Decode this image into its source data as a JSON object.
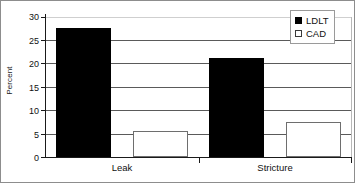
{
  "chart_data": {
    "type": "bar",
    "title": "",
    "subtitle": "",
    "xlabel": "",
    "ylabel": "Percent",
    "categories": [
      "Leak",
      "Stricture"
    ],
    "series": [
      {
        "name": "LDLT",
        "values": [
          27.4,
          21.0
        ],
        "color": "#000000",
        "marker": "filled-square"
      },
      {
        "name": "CAD",
        "values": [
          5.5,
          7.4
        ],
        "color": "#ffffff",
        "marker": "open-square"
      }
    ],
    "ylim": [
      0,
      30
    ],
    "ytick_step": 5,
    "ytick_labels": [
      "0",
      "5",
      "10",
      "15",
      "20",
      "25",
      "30"
    ],
    "grid": "horizontal",
    "legend_position": "top-right",
    "annotations": []
  },
  "legend": {
    "items": [
      {
        "label": "LDLT",
        "swatch": "filled-square-black"
      },
      {
        "label": "CAD",
        "swatch": "open-square-white"
      }
    ]
  },
  "axes": {
    "y_title": "Percent"
  },
  "colors": {
    "series_ldlt": "#000000",
    "series_cad": "#ffffff",
    "gridline": "#5a5a5a",
    "axis": "#1a1a1a",
    "frame": "#8d8d8d",
    "background": "#ffffff"
  }
}
